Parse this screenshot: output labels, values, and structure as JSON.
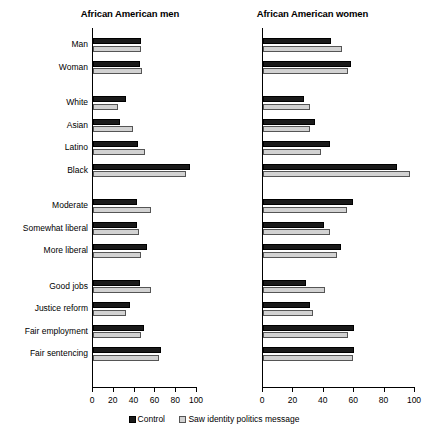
{
  "chart_data": {
    "type": "bar",
    "orientation": "horizontal",
    "title": "",
    "xlabel": "",
    "ylabel": "",
    "xlim": [
      0,
      100
    ],
    "xticks": [
      0,
      20,
      40,
      60,
      80,
      100
    ],
    "grid": false,
    "legend_position": "bottom",
    "legend": [
      "Control",
      "Saw identity politics message"
    ],
    "colors": {
      "control": "#1a1a1a",
      "treatment": "#d2d2d2"
    },
    "categories": [
      "Man",
      "Woman",
      "White",
      "Asian",
      "Latino",
      "Black",
      "Moderate",
      "Somewhat liberal",
      "More liberal",
      "Good jobs",
      "Justice reform",
      "Fair employment",
      "Fair sentencing"
    ],
    "group_breaks_after": [
      "Woman",
      "Black",
      "More liberal"
    ],
    "panels": [
      {
        "title": "African American men",
        "series": [
          {
            "name": "Control",
            "values": [
              46,
              45,
              32,
              26,
              43,
              93,
              42,
              42,
              52,
              45,
              36,
              49,
              65
            ]
          },
          {
            "name": "Saw identity politics message",
            "values": [
              46,
              47,
              24,
              38,
              50,
              89,
              56,
              44,
              46,
              56,
              32,
              46,
              63
            ]
          }
        ]
      },
      {
        "title": "African American women",
        "series": [
          {
            "name": "Control",
            "values": [
              45,
              58,
              27,
              34,
              44,
              88,
              59,
              40,
              51,
              28,
              31,
              60,
              60
            ]
          },
          {
            "name": "Saw identity politics message",
            "values": [
              52,
              56,
              31,
              31,
              38,
              97,
              55,
              44,
              49,
              41,
              33,
              56,
              59
            ]
          }
        ]
      }
    ]
  }
}
